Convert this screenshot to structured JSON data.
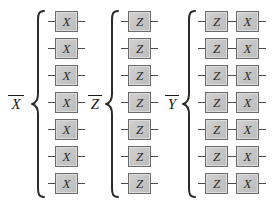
{
  "figure": {
    "background_color": "#ffffff",
    "gate_fill_color": "#c9c9c9",
    "gate_border_color": "#6b6b6b",
    "wire_color": "#4a4a4a",
    "text_color": "#1a1a1a"
  },
  "groups": [
    {
      "id": "x-bar",
      "label": "X",
      "label_overline": true,
      "label_full": "X̄",
      "brace": "left-curly-brace",
      "row_count": 7,
      "rows": [
        {
          "gates": [
            "X"
          ]
        },
        {
          "gates": [
            "X"
          ]
        },
        {
          "gates": [
            "X"
          ]
        },
        {
          "gates": [
            "X"
          ]
        },
        {
          "gates": [
            "X"
          ]
        },
        {
          "gates": [
            "X"
          ]
        },
        {
          "gates": [
            "X"
          ]
        }
      ]
    },
    {
      "id": "z-bar",
      "label": "Z",
      "label_overline": true,
      "label_full": "Z̄",
      "brace": "left-curly-brace",
      "row_count": 7,
      "rows": [
        {
          "gates": [
            "Z"
          ]
        },
        {
          "gates": [
            "Z"
          ]
        },
        {
          "gates": [
            "Z"
          ]
        },
        {
          "gates": [
            "Z"
          ]
        },
        {
          "gates": [
            "Z"
          ]
        },
        {
          "gates": [
            "Z"
          ]
        },
        {
          "gates": [
            "Z"
          ]
        }
      ]
    },
    {
      "id": "y-bar",
      "label": "Y",
      "label_overline": true,
      "label_full": "Ȳ",
      "brace": "left-curly-brace",
      "row_count": 7,
      "rows": [
        {
          "gates": [
            "Z",
            "X"
          ]
        },
        {
          "gates": [
            "Z",
            "X"
          ]
        },
        {
          "gates": [
            "Z",
            "X"
          ]
        },
        {
          "gates": [
            "Z",
            "X"
          ]
        },
        {
          "gates": [
            "Z",
            "X"
          ]
        },
        {
          "gates": [
            "Z",
            "X"
          ]
        },
        {
          "gates": [
            "Z",
            "X"
          ]
        }
      ]
    }
  ]
}
